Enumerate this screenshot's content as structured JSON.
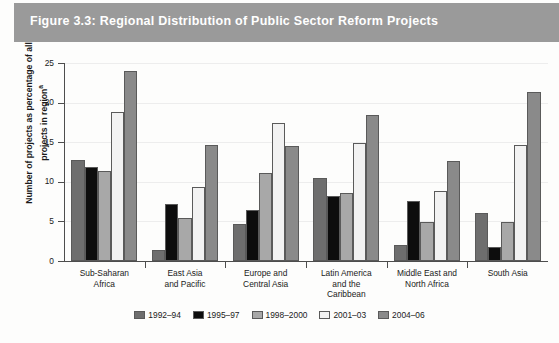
{
  "figure": {
    "title": "Figure 3.3: Regional Distribution of Public Sector Reform Projects",
    "banner_color": "#9a9a9a"
  },
  "chart_data": {
    "type": "bar",
    "title": "Figure 3.3: Regional Distribution of Public Sector Reform Projects",
    "xlabel": "",
    "ylabel": "Number of projects as percentage of all projects in region",
    "ylabel_footnote_marker": "a",
    "ylim": [
      0,
      25
    ],
    "yticks": [
      0,
      5,
      10,
      15,
      20,
      25
    ],
    "grid": true,
    "legend_position": "bottom",
    "categories": [
      "Sub-Saharan Africa",
      "East Asia and Pacific",
      "Europe and Central Asia",
      "Latin America and the Caribbean",
      "Middle East and North Africa",
      "South Asia"
    ],
    "category_label_lines": [
      [
        "Sub-Saharan",
        "Africa"
      ],
      [
        "East Asia",
        "and Pacific"
      ],
      [
        "Europe and",
        "Central Asia"
      ],
      [
        "Latin America",
        "and the",
        "Caribbean"
      ],
      [
        "Middle East and",
        "North Africa"
      ],
      [
        "South Asia"
      ]
    ],
    "series": [
      {
        "name": "1992–94",
        "color": "#6e6e6e",
        "values": [
          12.7,
          1.4,
          4.7,
          10.5,
          2.0,
          6.0
        ]
      },
      {
        "name": "1995–97",
        "color": "#0d0d0d",
        "values": [
          11.9,
          7.2,
          6.5,
          8.2,
          7.6,
          1.8
        ]
      },
      {
        "name": "1998–2000",
        "color": "#a8a8a8",
        "values": [
          11.4,
          5.4,
          11.1,
          8.6,
          4.9,
          4.9
        ]
      },
      {
        "name": "2001–03",
        "color": "#f2f2f2",
        "values": [
          18.8,
          9.4,
          17.4,
          14.9,
          8.9,
          14.7
        ]
      },
      {
        "name": "2004–06",
        "color": "#8a8a8a",
        "values": [
          24.0,
          14.6,
          14.5,
          18.4,
          12.6,
          21.3
        ]
      }
    ]
  }
}
